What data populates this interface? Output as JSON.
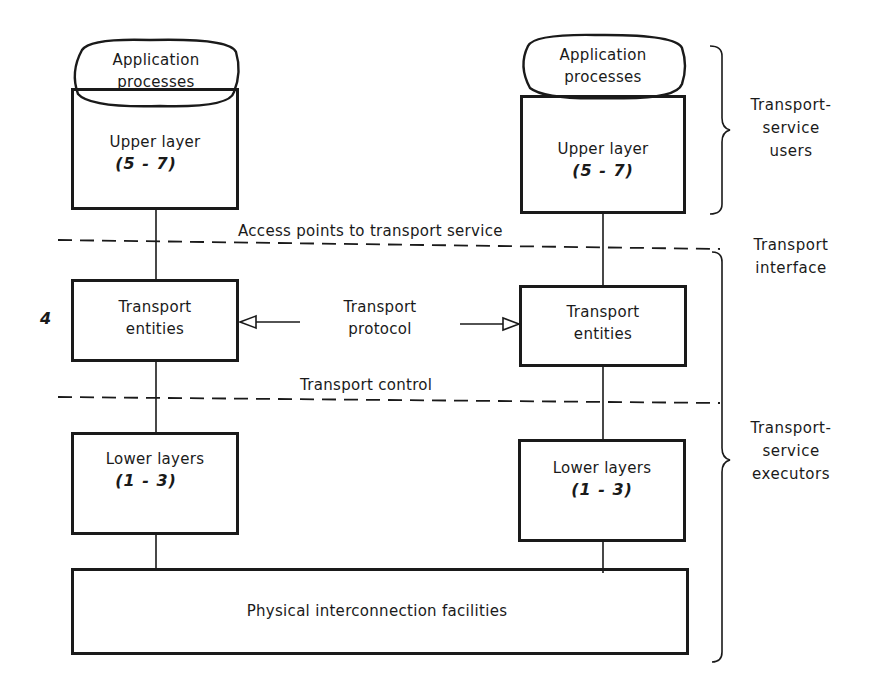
{
  "diagram": {
    "left_stack": {
      "app_processes": [
        "Application",
        "processes"
      ],
      "upper_layer": {
        "label": "Upper layer",
        "range": "(5 - 7)"
      },
      "transport_entities": [
        "Transport",
        "entities"
      ],
      "lower_layers": {
        "label": "Lower layers",
        "range": "(1 - 3)"
      }
    },
    "right_stack": {
      "app_processes": [
        "Application",
        "processes"
      ],
      "upper_layer": {
        "label": "Upper layer",
        "range": "(5 - 7)"
      },
      "transport_entities": [
        "Transport",
        "entities"
      ],
      "lower_layers": {
        "label": "Lower layers",
        "range": "(1 - 3)"
      }
    },
    "layer_number": "4",
    "protocol_label": [
      "Transport",
      "protocol"
    ],
    "access_points_label": "Access points to transport service",
    "transport_control_label": "Transport control",
    "physical_label": "Physical interconnection facilities",
    "side_labels": {
      "users": [
        "Transport-",
        "service",
        "users"
      ],
      "interface": [
        "Transport",
        "interface"
      ],
      "executors": [
        "Transport-",
        "service",
        "executors"
      ]
    },
    "colors": {
      "ink": "#1a1a1a",
      "background": "#ffffff"
    }
  }
}
